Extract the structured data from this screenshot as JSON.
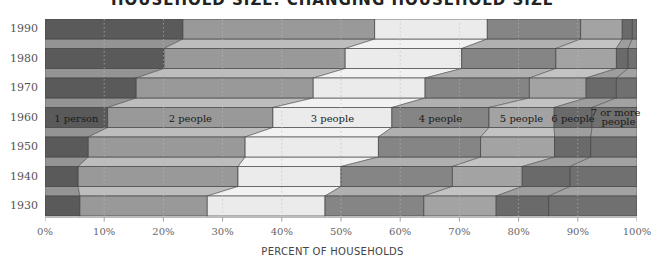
{
  "title": "HOUSEHOLD SIZE: CHANGING HOUSEHOLD SIZE",
  "chart_data": {
    "type": "bar",
    "orientation": "horizontal",
    "stacked": "100%",
    "title": "",
    "xlabel": "PERCENT OF HOUSEHOLDS",
    "ylabel": "",
    "xlim": [
      0,
      100
    ],
    "x_ticks": [
      "0%",
      "10%",
      "20%",
      "30%",
      "40%",
      "50%",
      "60%",
      "70%",
      "80%",
      "90%",
      "100%"
    ],
    "categories": [
      "1990",
      "1980",
      "1970",
      "1960",
      "1950",
      "1940",
      "1930"
    ],
    "series": [
      {
        "name": "1 person",
        "color": "#5a5a5a",
        "values": [
          23.3,
          20.1,
          15.4,
          10.6,
          7.3,
          5.6,
          5.9
        ]
      },
      {
        "name": "2 people",
        "color": "#999999",
        "values": [
          32.4,
          30.6,
          29.9,
          27.9,
          26.5,
          27.0,
          21.5
        ]
      },
      {
        "name": "3 people",
        "color": "#ebebeb",
        "values": [
          19.0,
          19.7,
          18.9,
          20.1,
          22.5,
          17.4,
          19.9
        ]
      },
      {
        "name": "4 people",
        "color": "#858585",
        "values": [
          15.8,
          15.9,
          17.6,
          16.4,
          17.3,
          18.8,
          16.7
        ]
      },
      {
        "name": "5 people",
        "color": "#a3a3a3",
        "values": [
          7.0,
          10.2,
          9.6,
          11.0,
          12.5,
          11.8,
          12.2
        ]
      },
      {
        "name": "6 people",
        "color": "#6a6a6a",
        "values": [
          1.7,
          2.0,
          5.1,
          6.4,
          6.1,
          8.1,
          8.9
        ]
      },
      {
        "name": "7 or more people",
        "color": "#707070",
        "values": [
          0.8,
          1.5,
          3.5,
          7.6,
          7.8,
          11.3,
          14.9
        ]
      }
    ],
    "grid": "vertical dotted lines at each 10%",
    "legend": "inline labels on the 1960 bar"
  },
  "segment_labels": {
    "p1": "1 person",
    "p2": "2 people",
    "p3": "3 people",
    "p4": "4 people",
    "p5": "5 people",
    "p6": "6 people",
    "p7a": "7 or more",
    "p7b": "people"
  }
}
